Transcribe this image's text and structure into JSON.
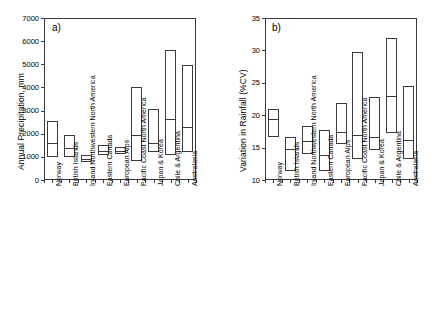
{
  "figure": {
    "panels": [
      {
        "id": "a",
        "label": "a)",
        "ylabel": "Annual Precipitation, mm"
      },
      {
        "id": "b",
        "label": "b)",
        "ylabel": "Variation in Rainfall (%CV)"
      }
    ]
  },
  "chart_data": [
    {
      "type": "box",
      "panel": "a",
      "title": "a)",
      "xlabel": "",
      "ylabel": "Annual Precipitation, mm",
      "ylim": [
        0,
        7000
      ],
      "yticks": [
        0,
        1000,
        2000,
        3000,
        4000,
        5000,
        6000,
        7000
      ],
      "ytick_labels": [
        "0",
        "1000",
        "2000",
        "3000",
        "4000",
        "5000",
        "6000",
        "7000"
      ],
      "grid": false,
      "legend": "none",
      "categories": [
        "Norway",
        "British Islands",
        "Inland Northwestern North America",
        "Eastern Canada",
        "European Alps",
        "Pacific Coast North America",
        "Japan & Korea",
        "Chile & Argentina",
        "Australasia"
      ],
      "boxes": [
        {
          "category": "Norway",
          "low": 1000,
          "median": 1580,
          "high": 2550
        },
        {
          "category": "British Islands",
          "low": 1010,
          "median": 1390,
          "high": 1950
        },
        {
          "category": "Inland Northwestern North America",
          "low": 760,
          "median": 890,
          "high": 1080
        },
        {
          "category": "Eastern Canada",
          "low": 1060,
          "median": 1240,
          "high": 1530
        },
        {
          "category": "European Alps",
          "low": 1130,
          "median": 1260,
          "high": 1440
        },
        {
          "category": "Pacific Coast North America",
          "low": 800,
          "median": 1960,
          "high": 4000
        },
        {
          "category": "Japan & Korea",
          "low": 1210,
          "median": 1600,
          "high": 3060
        },
        {
          "category": "Chile & Argentina",
          "low": 1100,
          "median": 2620,
          "high": 5620
        },
        {
          "category": "Australasia",
          "low": 1210,
          "median": 2290,
          "high": 4950
        }
      ]
    },
    {
      "type": "box",
      "panel": "b",
      "title": "b)",
      "xlabel": "",
      "ylabel": "Variation in Rainfall (%CV)",
      "ylim": [
        10,
        35
      ],
      "yticks": [
        10,
        15,
        20,
        25,
        30,
        35
      ],
      "ytick_labels": [
        "10",
        "15",
        "20",
        "25",
        "30",
        "35"
      ],
      "grid": false,
      "legend": "none",
      "categories": [
        "Norway",
        "British Islands",
        "Inland Northwestern North America",
        "Eastern Canada",
        "European Alps",
        "Pacific Coast North America",
        "Japan & Korea",
        "Chile & Argentina",
        "Australasia"
      ],
      "boxes": [
        {
          "category": "Norway",
          "low": 16.6,
          "median": 19.4,
          "high": 20.9
        },
        {
          "category": "British Islands",
          "low": 11.4,
          "median": 14.8,
          "high": 16.7
        },
        {
          "category": "Inland Northwestern North America",
          "low": 14.0,
          "median": 16.0,
          "high": 18.3
        },
        {
          "category": "Eastern Canada",
          "low": 11.4,
          "median": 13.9,
          "high": 17.7
        },
        {
          "category": "European Alps",
          "low": 15.5,
          "median": 17.4,
          "high": 21.9
        },
        {
          "category": "Pacific Coast North America",
          "low": 13.3,
          "median": 16.9,
          "high": 29.7
        },
        {
          "category": "Japan & Korea",
          "low": 14.7,
          "median": 16.6,
          "high": 22.8
        },
        {
          "category": "Chile & Argentina",
          "low": 17.2,
          "median": 22.9,
          "high": 31.9
        },
        {
          "category": "Australasia",
          "low": 13.3,
          "median": 16.2,
          "high": 24.5
        }
      ]
    }
  ]
}
